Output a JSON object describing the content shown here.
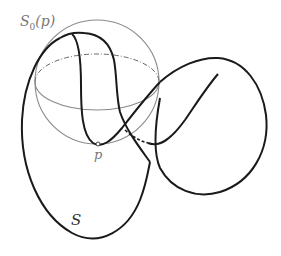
{
  "figure": {
    "labels": {
      "sphere": "S",
      "sphere_sub": "0",
      "sphere_arg": "(p)",
      "point": "p",
      "surface": "S"
    },
    "colors": {
      "surface_curve": "#1a1a1a",
      "sphere": "#8a8a8a",
      "point_fill": "#ffffff",
      "background": "#ffffff"
    }
  }
}
